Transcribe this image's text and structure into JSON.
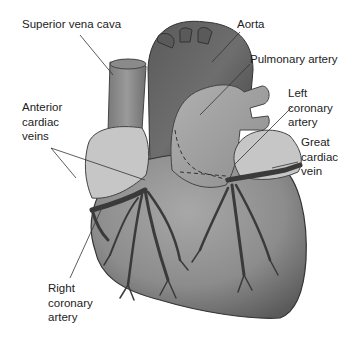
{
  "diagram": {
    "labels": [
      {
        "id": "superior-vena-cava",
        "text": "Superior vena cava"
      },
      {
        "id": "aorta",
        "text": "Aorta"
      },
      {
        "id": "pulmonary-artery",
        "text": "Pulmonary artery"
      },
      {
        "id": "left-coronary-artery",
        "text": "Left\ncoronary\nartery"
      },
      {
        "id": "anterior-cardiac-veins",
        "text": "Anterior\ncardiac\nveins"
      },
      {
        "id": "great-cardiac-vein",
        "text": "Great\ncardiac\nvein"
      },
      {
        "id": "right-coronary-artery",
        "text": "Right\ncoronary\nartery"
      }
    ],
    "colors": {
      "heart_body": "#8a8a8a",
      "heart_dark": "#4a4a4a",
      "atria_fat": "#c8c8c8",
      "vessels": "#3a3a3a",
      "label_text": "#222222"
    }
  }
}
